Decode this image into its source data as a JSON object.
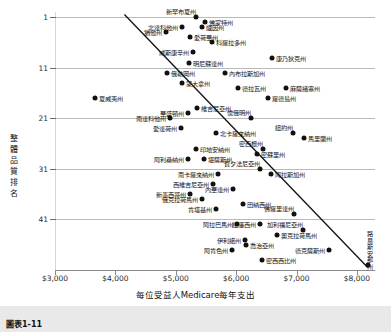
{
  "figure": {
    "caption": "圖表1-11",
    "background": "#ffffff",
    "point_color": "#111111",
    "trendline_color": "#111111",
    "grid_color": "#b9b9b9"
  },
  "chart_data": {
    "type": "scatter",
    "title": "",
    "xlabel": "每位受益人Medicare每年支出",
    "ylabel": "整體品質排名",
    "xlim": [
      3000,
      8300
    ],
    "ylim": [
      0,
      51
    ],
    "y_inverted": true,
    "grid": true,
    "legend": null,
    "xticks": [
      3000,
      4000,
      5000,
      6000,
      7000,
      8000
    ],
    "xticklabels": [
      "$3,000",
      "$4,000",
      "$5,000",
      "$6,000",
      "$7,000",
      "$8,000"
    ],
    "yticks": [
      1,
      11,
      21,
      31,
      41
    ],
    "yticklabels": [
      "1",
      "11",
      "21",
      "31",
      "41"
    ],
    "trendline": {
      "x0": 4150,
      "y0": 0.5,
      "x1": 8180,
      "y1": 50.5
    },
    "points": [
      {
        "label": "新罕布夏州",
        "x": 5330,
        "y": 1,
        "side": "above"
      },
      {
        "label": "佛蒙特州",
        "x": 5490,
        "y": 2,
        "side": "right"
      },
      {
        "label": "北達科他州",
        "x": 5100,
        "y": 3,
        "side": "left"
      },
      {
        "label": "緬因州",
        "x": 5440,
        "y": 3,
        "side": "right"
      },
      {
        "label": "猶他州",
        "x": 4840,
        "y": 4,
        "side": "left"
      },
      {
        "label": "愛荷華州",
        "x": 5230,
        "y": 5,
        "side": "right"
      },
      {
        "label": "科羅拉多州",
        "x": 5600,
        "y": 6,
        "side": "right"
      },
      {
        "label": "威斯康辛州",
        "x": 5280,
        "y": 8,
        "side": "left"
      },
      {
        "label": "康乃狄克州",
        "x": 6600,
        "y": 9,
        "side": "right"
      },
      {
        "label": "明尼蘇達州",
        "x": 5220,
        "y": 10,
        "side": "right"
      },
      {
        "label": "俄勒岡州",
        "x": 4850,
        "y": 12,
        "side": "right"
      },
      {
        "label": "內布拉斯加州",
        "x": 5820,
        "y": 12,
        "side": "right"
      },
      {
        "label": "蒙大拿州",
        "x": 5100,
        "y": 14,
        "side": "right"
      },
      {
        "label": "德拉瓦州",
        "x": 6030,
        "y": 15,
        "side": "right"
      },
      {
        "label": "麻薩諸塞州",
        "x": 6830,
        "y": 15,
        "side": "right"
      },
      {
        "label": "夏威夷州",
        "x": 3670,
        "y": 17,
        "side": "right"
      },
      {
        "label": "羅德島州",
        "x": 6530,
        "y": 17,
        "side": "right"
      },
      {
        "label": "維吉尼亞州",
        "x": 5360,
        "y": 19,
        "side": "right"
      },
      {
        "label": "華盛頓州",
        "x": 5200,
        "y": 20,
        "side": "left"
      },
      {
        "label": "南達科他州",
        "x": 4910,
        "y": 21,
        "side": "left"
      },
      {
        "label": "懷俄明州",
        "x": 6250,
        "y": 21,
        "side": "above"
      },
      {
        "label": "愛達荷州",
        "x": 5080,
        "y": 23,
        "side": "left"
      },
      {
        "label": "北卡羅來納州",
        "x": 5660,
        "y": 24,
        "side": "right"
      },
      {
        "label": "紐約州",
        "x": 6940,
        "y": 24,
        "side": "above"
      },
      {
        "label": "馬里蘭州",
        "x": 7120,
        "y": 25,
        "side": "right"
      },
      {
        "label": "印地安納州",
        "x": 5340,
        "y": 27,
        "side": "right"
      },
      {
        "label": "密西根州",
        "x": 6450,
        "y": 27,
        "side": "above"
      },
      {
        "label": "密蘇里州",
        "x": 6350,
        "y": 28,
        "side": "right"
      },
      {
        "label": "阿利桑納州",
        "x": 5200,
        "y": 29,
        "side": "left"
      },
      {
        "label": "堪薩斯州",
        "x": 5470,
        "y": 29,
        "side": "right"
      },
      {
        "label": "賓夕法尼亞州",
        "x": 6400,
        "y": 31,
        "side": "above"
      },
      {
        "label": "南卡羅來納州",
        "x": 5700,
        "y": 32,
        "side": "left"
      },
      {
        "label": "阿拉斯加州",
        "x": 6580,
        "y": 32,
        "side": "right"
      },
      {
        "label": "西維吉尼亞州",
        "x": 5620,
        "y": 34,
        "side": "left"
      },
      {
        "label": "內華達州",
        "x": 5940,
        "y": 35,
        "side": "left"
      },
      {
        "label": "新墨西哥州",
        "x": 5230,
        "y": 36,
        "side": "left"
      },
      {
        "label": "俄克拉荷馬州",
        "x": 5430,
        "y": 37,
        "side": "left"
      },
      {
        "label": "田納西州",
        "x": 6110,
        "y": 38,
        "side": "right"
      },
      {
        "label": "肯塔基州",
        "x": 5670,
        "y": 39,
        "side": "left"
      },
      {
        "label": "佛羅里達州",
        "x": 6960,
        "y": 40,
        "side": "above"
      },
      {
        "label": "阿拉巴馬州",
        "x": 6020,
        "y": 42,
        "side": "left"
      },
      {
        "label": "紐澤西州",
        "x": 6400,
        "y": 42,
        "side": "left"
      },
      {
        "label": "加利福尼亞州",
        "x": 7100,
        "y": 43,
        "side": "above"
      },
      {
        "label": "奧克拉荷馬州",
        "x": 6680,
        "y": 44,
        "side": "right"
      },
      {
        "label": "伊利諾州",
        "x": 6150,
        "y": 45,
        "side": "left"
      },
      {
        "label": "喬治亞州",
        "x": 6170,
        "y": 46,
        "side": "right"
      },
      {
        "label": "阿肯色州",
        "x": 5930,
        "y": 47,
        "side": "left"
      },
      {
        "label": "德克薩斯州",
        "x": 7540,
        "y": 47,
        "side": "left"
      },
      {
        "label": "密西西比州",
        "x": 6430,
        "y": 49,
        "side": "right"
      },
      {
        "label": "路易斯安那州",
        "x": 8180,
        "y": 50,
        "side": "vertical"
      }
    ]
  }
}
